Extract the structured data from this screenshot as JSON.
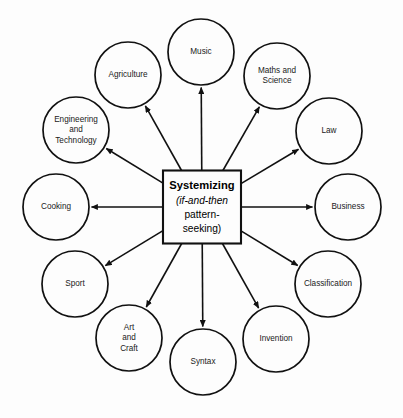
{
  "diagram": {
    "background_color": "#fdfdfd",
    "line_color": "#111111",
    "text_color": "#1a1a1a",
    "center": {
      "title": "Systemizing",
      "subtitle_line1": "(if-and-then",
      "subtitle_line2": "pattern-",
      "subtitle_line3": "seeking)",
      "cx": 202,
      "cy": 207,
      "width": 78,
      "height": 73
    },
    "arrow_direction": "outward-from-center",
    "node_radius": 34,
    "orbit_radius": 146,
    "nodes": [
      {
        "id": "music",
        "label": "Music",
        "lines": [
          "Music"
        ],
        "cx": 201,
        "cy": 52,
        "r": 33,
        "angle_deg": 270
      },
      {
        "id": "maths-and-science",
        "label": "Maths and Science",
        "lines": [
          "Maths and",
          "Science"
        ],
        "cx": 277,
        "cy": 76,
        "r": 33,
        "angle_deg": 300
      },
      {
        "id": "law",
        "label": "Law",
        "lines": [
          "Law"
        ],
        "cx": 329,
        "cy": 131,
        "r": 33,
        "angle_deg": 330
      },
      {
        "id": "business",
        "label": "Business",
        "lines": [
          "Business"
        ],
        "cx": 348,
        "cy": 207,
        "r": 33,
        "angle_deg": 0
      },
      {
        "id": "classification",
        "label": "Classification",
        "lines": [
          "Classification"
        ],
        "cx": 328,
        "cy": 284,
        "r": 33,
        "angle_deg": 30
      },
      {
        "id": "invention",
        "label": "Invention",
        "lines": [
          "Invention"
        ],
        "cx": 276,
        "cy": 339,
        "r": 33,
        "angle_deg": 60
      },
      {
        "id": "syntax",
        "label": "Syntax",
        "lines": [
          "Syntax"
        ],
        "cx": 203,
        "cy": 362,
        "r": 33,
        "angle_deg": 90
      },
      {
        "id": "art-and-craft",
        "label": "Art and Craft",
        "lines": [
          "Art",
          "and",
          "Craft"
        ],
        "cx": 129,
        "cy": 338,
        "r": 33,
        "angle_deg": 120
      },
      {
        "id": "sport",
        "label": "Sport",
        "lines": [
          "Sport"
        ],
        "cx": 75,
        "cy": 284,
        "r": 33,
        "angle_deg": 150
      },
      {
        "id": "cooking",
        "label": "Cooking",
        "lines": [
          "Cooking"
        ],
        "cx": 56,
        "cy": 207,
        "r": 33,
        "angle_deg": 180
      },
      {
        "id": "engineering-and-technology",
        "label": "Engineering and Technology",
        "lines": [
          "Engineering",
          "and",
          "Technology"
        ],
        "cx": 76,
        "cy": 130,
        "r": 33,
        "angle_deg": 210
      },
      {
        "id": "agriculture",
        "label": "Agriculture",
        "lines": [
          "Agriculture"
        ],
        "cx": 128,
        "cy": 75,
        "r": 33,
        "angle_deg": 240
      }
    ]
  }
}
